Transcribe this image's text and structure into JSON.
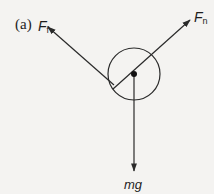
{
  "figure": {
    "panel_label": "(a)",
    "background": "#f4f3f1",
    "stroke_color": "#2a2a2a",
    "body": {
      "shape": "circle",
      "center": [
        134,
        74
      ],
      "radius": 26,
      "center_dot_radius": 3
    },
    "forces": [
      {
        "id": "friction",
        "symbol": "F",
        "subscript": "f",
        "from": [
          114,
          85
        ],
        "to": [
          48,
          27
        ]
      },
      {
        "id": "normal",
        "symbol": "F",
        "subscript": "n",
        "from": [
          113,
          89
        ],
        "to": [
          190,
          20
        ]
      },
      {
        "id": "weight",
        "symbol": "mg",
        "subscript": "",
        "from": [
          134,
          74
        ],
        "to": [
          134,
          171
        ]
      }
    ]
  }
}
